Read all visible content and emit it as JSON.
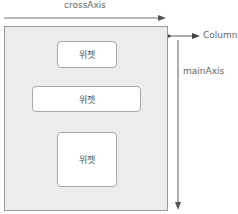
{
  "diagram": {
    "cross_axis_label": "crossAxis",
    "main_axis_label": "mainAxis",
    "container_label": "Column",
    "widgets": [
      {
        "label": "위젯"
      },
      {
        "label": "위젯"
      },
      {
        "label": "위젯"
      }
    ],
    "colors": {
      "container_fill": "#ececec",
      "container_border": "#9a9a9a",
      "widget_fill": "#ffffff",
      "arrow": "#555555"
    }
  }
}
